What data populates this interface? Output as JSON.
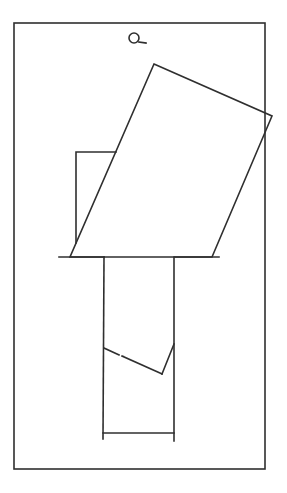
{
  "canvas": {
    "width": 287,
    "height": 493,
    "background": "#ffffff",
    "stroke": "#2f2f2f"
  },
  "frame": {
    "x": 14,
    "y": 23,
    "width": 251,
    "height": 446
  },
  "magnifier_icon": {
    "cx": 134,
    "cy": 38,
    "r": 5,
    "tail": [
      139,
      42,
      146,
      43
    ]
  },
  "rotated_rect": {
    "points": "154,64 272,116 212,257 70,257"
  },
  "small_rect": {
    "points": "116,152 76,152 76,243"
  },
  "left_ledge": [
    59,
    257,
    104,
    257
  ],
  "right_ledge": [
    175,
    257,
    219,
    257
  ],
  "left_post": [
    104,
    257,
    103,
    439
  ],
  "right_post": [
    174,
    257,
    174,
    441
  ],
  "zigzag": [
    {
      "x1": 104,
      "y1": 348,
      "x2": 119,
      "y2": 355
    },
    {
      "x1": 122,
      "y1": 356,
      "x2": 162,
      "y2": 374
    },
    {
      "x1": 162,
      "y1": 374,
      "x2": 174,
      "y2": 344
    }
  ],
  "base_bar": [
    103,
    433,
    174,
    433
  ]
}
